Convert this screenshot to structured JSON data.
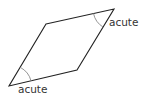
{
  "diagram": {
    "shape": "parallelogram",
    "vertices": {
      "top_left": [
        46,
        24
      ],
      "top_right": [
        114,
        9
      ],
      "bottom_right": [
        77,
        70
      ],
      "bottom_left": [
        9,
        86
      ]
    },
    "stroke_color": "#222222",
    "arc_color": "#888888",
    "labels": {
      "top_right_angle": "acute",
      "bottom_left_angle": "acute"
    }
  }
}
